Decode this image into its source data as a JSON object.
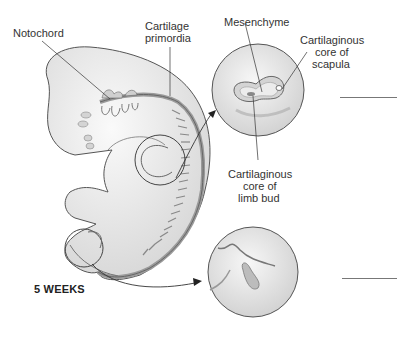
{
  "figure": {
    "stage_label": "5 WEEKS",
    "labels": {
      "notochord": "Notochord",
      "cartilage_primordia_line1": "Cartilage",
      "cartilage_primordia_line2": "primordia",
      "mesenchyme": "Mesenchyme",
      "scapula_line1": "Cartilaginous",
      "scapula_line2": "core of",
      "scapula_line3": "scapula",
      "limb_bud_line1": "Cartilaginous",
      "limb_bud_line2": "core of",
      "limb_bud_line3": "limb bud"
    },
    "answer_blanks": [
      {
        "id": "upper-blank",
        "value": ""
      },
      {
        "id": "lower-blank",
        "value": ""
      }
    ],
    "colors": {
      "outline": "#555555",
      "embryo_fill": "#e8e8e8",
      "cartilage_fill": "#c8c8c8",
      "text": "#333333"
    }
  }
}
